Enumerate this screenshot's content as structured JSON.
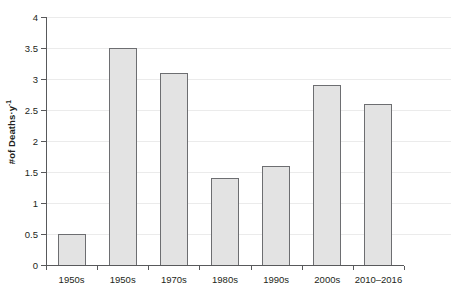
{
  "chart_data": {
    "type": "bar",
    "title": "",
    "subtitle": "",
    "xlabel": "",
    "ylabel": "#of Deaths·y",
    "ylabel_superscript": "-1",
    "categories": [
      "1950s",
      "1950s",
      "1970s",
      "1980s",
      "1990s",
      "2000s",
      "2010–2016"
    ],
    "values": [
      0.5,
      3.5,
      3.1,
      1.4,
      1.6,
      2.9,
      2.6
    ],
    "ylim": [
      0,
      4
    ],
    "ytick_step": 0.5,
    "ytick_labels": [
      "0",
      "0.5",
      "1",
      "1.5",
      "2",
      "2.5",
      "3",
      "3.5",
      "4"
    ],
    "ytick_values": [
      0,
      0.5,
      1,
      1.5,
      2,
      2.5,
      3,
      3.5,
      4
    ],
    "grid": true,
    "grid_axis": "y",
    "legend": null,
    "legend_position": "none",
    "bar_fill_color": "#e3e3e3",
    "bar_border_color": "#6d6e71",
    "gridline_color": "#ebebeb",
    "axis_color": "#58595b",
    "text_color": "#231f20",
    "background_color": "#ffffff"
  }
}
